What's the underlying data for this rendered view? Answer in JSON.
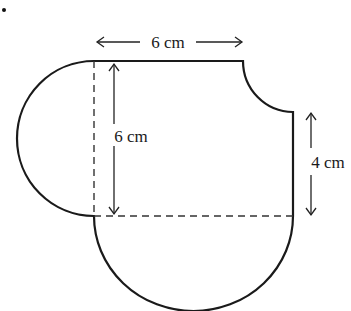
{
  "figure": {
    "bullet": "•",
    "labels": {
      "top_width": "6 cm",
      "left_height": "6 cm",
      "right_height": "4 cm"
    },
    "shapes": {
      "square": {
        "side_cm": 6
      },
      "left_semicircle": {
        "diameter_cm": 6
      },
      "bottom_semicircle": {
        "diameter_cm": 6
      },
      "quarter_circle_cutout": {
        "radius_cm": 2,
        "position": "top-right corner"
      }
    },
    "colors": {
      "stroke": "#1a1a1a",
      "background": "#ffffff"
    }
  }
}
